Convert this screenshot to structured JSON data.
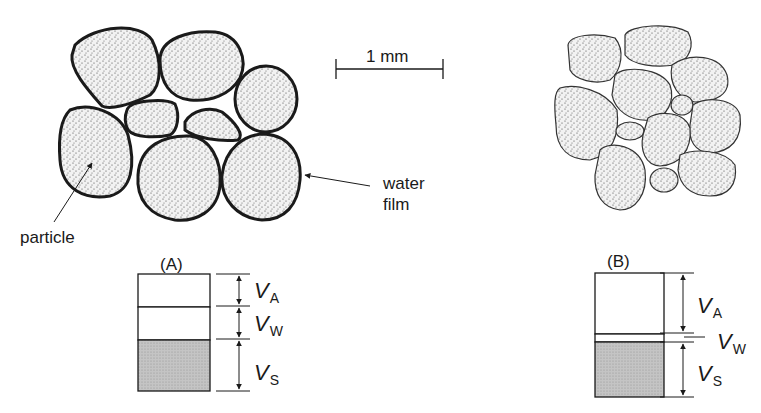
{
  "figure": {
    "scale_bar": {
      "label": "1 mm"
    },
    "panel_a": {
      "title": "(A)",
      "labels": {
        "particle": "particle",
        "water_film_line1": "water",
        "water_film_line2": "film"
      },
      "column": {
        "v_a": "V",
        "v_a_sub": "A",
        "v_w": "V",
        "v_w_sub": "W",
        "v_s": "V",
        "v_s_sub": "S"
      },
      "proportions": {
        "air": 0.28,
        "water": 0.28,
        "solid": 0.44
      }
    },
    "panel_b": {
      "title": "(B)",
      "column": {
        "v_a": "V",
        "v_a_sub": "A",
        "v_w": "V",
        "v_w_sub": "W",
        "v_s": "V",
        "v_s_sub": "S"
      },
      "proportions": {
        "air": 0.5,
        "water": 0.05,
        "solid": 0.45
      }
    },
    "colors": {
      "line": "#1a1a1a",
      "solid_fill": "#bdbdbd",
      "stipple": "#555555"
    }
  }
}
